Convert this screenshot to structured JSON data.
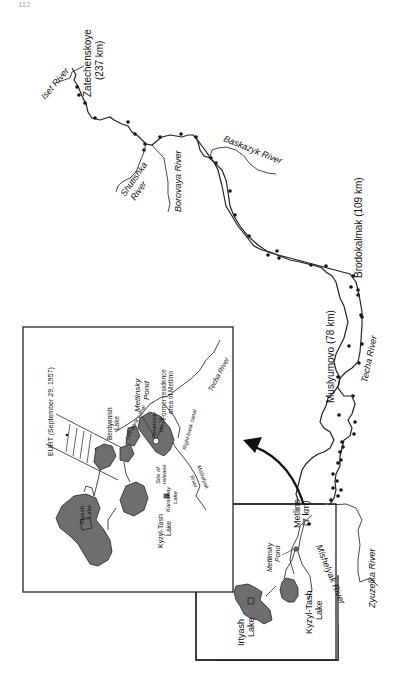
{
  "page_number": "112",
  "colors": {
    "ink": "#111111",
    "lake_fill": "#6e6e6e",
    "background": "#ffffff"
  },
  "main_map": {
    "rivers": [
      {
        "name": "Techa River",
        "label": "Techa River"
      },
      {
        "name": "Iset River",
        "label": "Iset River"
      },
      {
        "name": "Shutishka River",
        "label": "Shutishka River"
      },
      {
        "name": "Borovaya River",
        "label": "Borovaya River"
      },
      {
        "name": "Baskazyk River",
        "label": "Baskazyk River"
      },
      {
        "name": "Zyuzelka River",
        "label": "Zyuzelka River"
      },
      {
        "name": "Mishelyak River",
        "label": "Mishelyak River"
      }
    ],
    "settlements": [
      {
        "name": "Zatechenskoye",
        "label": "Zatechenskoye",
        "distance": "(237 km)"
      },
      {
        "name": "Brodokalmak",
        "label": "Brodokalmak (109 km)"
      },
      {
        "name": "Muslyumovo",
        "label": "Muslyumovo (78 km)"
      },
      {
        "name": "Metlino",
        "label": "Metlino",
        "distance": "(7 km)"
      }
    ],
    "lakes": [
      {
        "label_line1": "Irtyash",
        "label_line2": "Lake"
      },
      {
        "label_line1": "Kyzyl-Tash",
        "label_line2": "Lake"
      },
      {
        "label_line1": "Metlinsky",
        "label_line2": "Pond"
      }
    ]
  },
  "inset_map": {
    "eurt_label": "EURT (September 29, 1957)",
    "labels": {
      "berdyanish_1": "Berdyanish",
      "berdyanish_2": "Lake",
      "metlinsky_1": "Metlinsky",
      "metlinsky_2": "Pond",
      "former_1": "Former residence",
      "former_2": "area of Metlino",
      "techa": "Techa River",
      "left_canal": "Left-bank canal",
      "right_canal": "Right-bank canal",
      "reservoir_1": "Reservoir",
      "reservoir_2": "No.10",
      "site_1": "Site of",
      "site_2": "release",
      "karachay_1": "Karachay",
      "karachay_2": "Lake",
      "mishelyak_1": "Mishelyak",
      "mishelyak_2": "River",
      "kyzyl_1": "Kyzyl-Tash",
      "kyzyl_2": "Lake",
      "irtyash_1": "Irtyash",
      "irtyash_2": "Lake"
    }
  }
}
